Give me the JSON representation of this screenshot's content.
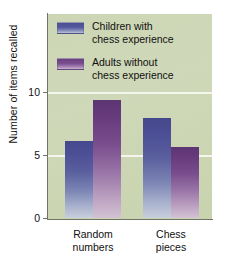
{
  "chart_data": {
    "type": "bar",
    "title": "",
    "xlabel": "",
    "ylabel": "Number of items recalled",
    "ylim": [
      0,
      11.5
    ],
    "yticks": [
      0,
      5,
      10
    ],
    "ytick_labels": [
      "0",
      "5",
      "10"
    ],
    "grid": true,
    "grid_axis": "y",
    "legend_position": "top-center-inside",
    "categories": [
      "Random numbers",
      "Chess pieces"
    ],
    "category_lines": [
      [
        "Random",
        "numbers"
      ],
      [
        "Chess",
        "pieces"
      ]
    ],
    "series": [
      {
        "name": "Children with chess experience",
        "name_lines": [
          "Children with",
          "chess experience"
        ],
        "color": "#4b4e92",
        "values": [
          6.1,
          7.9
        ]
      },
      {
        "name": "Adults without chess experience",
        "name_lines": [
          "Adults without",
          "chess experience"
        ],
        "color": "#6b3f80",
        "values": [
          9.4,
          5.6
        ]
      }
    ],
    "plot_background": "#ccd5b4",
    "gridline_color": "#f4f6ee",
    "axis_color": "#6f7466"
  },
  "axis": {
    "y_title": "Number of items recalled",
    "ticks": [
      {
        "label": "10",
        "value": 10
      },
      {
        "label": "5",
        "value": 5
      },
      {
        "label": "0",
        "value": 0
      }
    ]
  },
  "legend": {
    "items": [
      {
        "line1": "Children with",
        "line2": "chess experience",
        "swatch_color": "#4b4e92"
      },
      {
        "line1": "Adults without",
        "line2": "chess experience",
        "swatch_color": "#6b3f80"
      }
    ]
  },
  "categories": [
    {
      "line1": "Random",
      "line2": "numbers"
    },
    {
      "line1": "Chess",
      "line2": "pieces"
    }
  ],
  "bars": [
    {
      "group": 0,
      "series": 0,
      "value": 6.1,
      "label": "Children with chess experience – Random numbers"
    },
    {
      "group": 0,
      "series": 1,
      "value": 9.4,
      "label": "Adults without chess experience – Random numbers"
    },
    {
      "group": 1,
      "series": 0,
      "value": 7.9,
      "label": "Children with chess experience – Chess pieces"
    },
    {
      "group": 1,
      "series": 1,
      "value": 5.6,
      "label": "Adults without chess experience – Chess pieces"
    }
  ]
}
